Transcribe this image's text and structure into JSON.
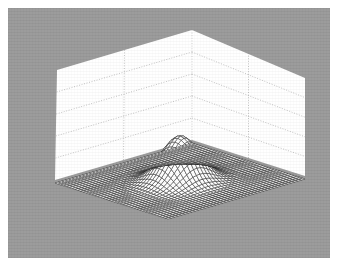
{
  "figure": {
    "kind": "surface-mesh-plot",
    "background_color": "#999999",
    "page_color": "#ffffff",
    "wall_color": "#ffffff",
    "gridline_color": "#b4b4b4",
    "mesh_color": "#1a1a1a",
    "axis_edge_color": "#9a9a9a",
    "frame": {
      "x": 8,
      "y": 8,
      "width": 322,
      "height": 250
    }
  },
  "chart_data": {
    "type": "surface",
    "title": "",
    "subtitle": "",
    "xlabel": "",
    "ylabel": "",
    "zlabel": "",
    "legend": [],
    "annotations": [],
    "grid": true,
    "legend_position": "none",
    "tick_labels": {
      "x": [],
      "y": [],
      "z": []
    },
    "xlim": [
      -3,
      3
    ],
    "ylim": [
      -3,
      3
    ],
    "zlim": [
      0,
      1
    ],
    "grid_divisions": {
      "x": 2,
      "y": 2,
      "z": 4
    },
    "mesh_resolution": {
      "nx": 41,
      "ny": 41
    },
    "function": "gaussian-bivariate-peak",
    "surface_formula": "z = exp(-(x^2 + y^2) / 0.9)",
    "peak": {
      "x": 0,
      "y": 0,
      "z": 1.0
    },
    "baseline": 0,
    "projection": {
      "type": "axonometric",
      "azimuth_deg": 45,
      "elevation_deg": 28
    },
    "screen_geometry": {
      "base_left": [
        55,
        180
      ],
      "base_front": [
        186,
        222
      ],
      "base_right": [
        305,
        176
      ],
      "base_back": [
        192,
        140
      ],
      "wall_top_left": [
        57,
        70
      ],
      "wall_top_center": [
        192,
        30
      ],
      "wall_top_right": [
        305,
        78
      ],
      "peak_apex": [
        190,
        95
      ]
    }
  }
}
